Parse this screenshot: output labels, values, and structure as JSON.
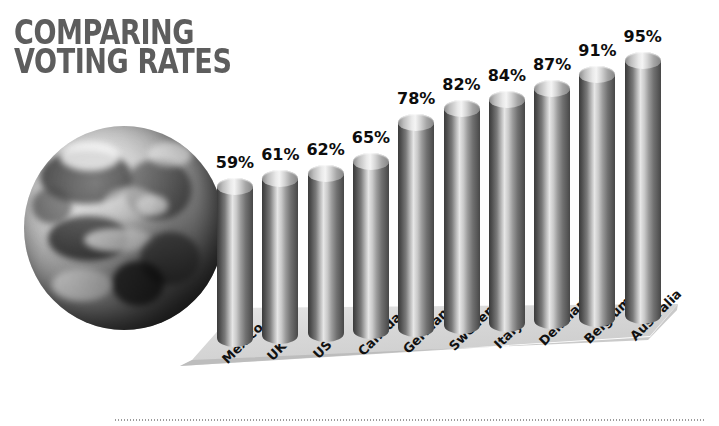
{
  "title": {
    "line1": "COMPARING",
    "line2": "VOTING RATES",
    "color": "#5d5d5d"
  },
  "graphic": {
    "globe_alt": "earth-globe",
    "ground_color": "#d8d8d8",
    "bar_color_light": "#e6e6e6",
    "bar_color_dark": "#3a3a3a",
    "label_color": "#0d0d0d",
    "dotted_rule_color": "#9b9b9b"
  },
  "chart_data": {
    "type": "bar",
    "title": "COMPARING VOTING RATES",
    "xlabel": "",
    "ylabel": "",
    "ylim": [
      0,
      100
    ],
    "grid": false,
    "legend": "none",
    "unit": "%",
    "categories": [
      "Mexico",
      "UK",
      "US",
      "Canada",
      "Germany",
      "Sweden",
      "Italy",
      "Denmark",
      "Belgium",
      "Australia"
    ],
    "values": [
      59,
      61,
      62,
      65,
      78,
      82,
      84,
      87,
      91,
      95
    ],
    "data_labels": [
      "59%",
      "61%",
      "62%",
      "65%",
      "78%",
      "82%",
      "84%",
      "87%",
      "91%",
      "95%"
    ]
  }
}
